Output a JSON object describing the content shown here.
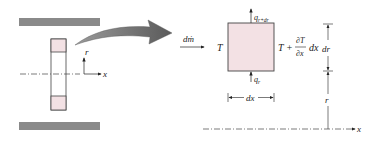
{
  "diagram": {
    "left": {
      "axis_r": "r",
      "axis_x": "x"
    },
    "mass_flow_label": "dṁ",
    "element": {
      "left_temp": "T",
      "right_temp_T": "T +",
      "right_temp_num": "∂T",
      "right_temp_den": "∂x",
      "right_temp_dx": "dx",
      "q_top": "q",
      "q_top_sub": "r+dr",
      "q_bottom": "q",
      "q_bottom_sub": "r",
      "width_label": "dx"
    },
    "right_dims": {
      "dr_label": "dr",
      "r_label": "r",
      "x_label": "x"
    },
    "colors": {
      "wall_gray": "#8a8a8a",
      "element_fill": "#f3e1e4",
      "arrow_gray": "#6e6e6e",
      "line": "#333333"
    }
  }
}
